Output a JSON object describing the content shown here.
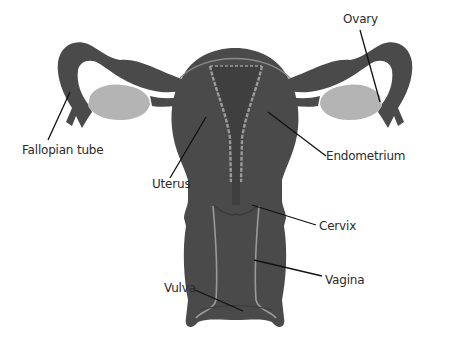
{
  "diagram": {
    "type": "anatomical-illustration",
    "colors": {
      "tissue": "#4a4a4a",
      "tissue_dark": "#3f3f3f",
      "lining": "#9a9a9a",
      "ovary": "#b4b4b4",
      "leader_line": "#111111",
      "label_text": "#2b2b2b",
      "background": "#ffffff"
    },
    "labels": [
      {
        "id": "ovary",
        "text": "Ovary"
      },
      {
        "id": "fallopian-tube",
        "text": "Fallopian tube"
      },
      {
        "id": "endometrium",
        "text": "Endometrium"
      },
      {
        "id": "uterus",
        "text": "Uterus"
      },
      {
        "id": "cervix",
        "text": "Cervix"
      },
      {
        "id": "vagina",
        "text": "Vagina"
      },
      {
        "id": "vulva",
        "text": "Vulva"
      }
    ]
  }
}
